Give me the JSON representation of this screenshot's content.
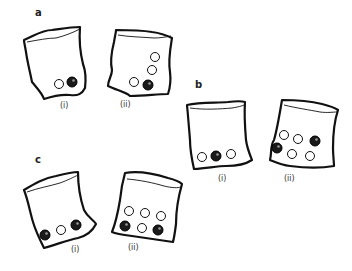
{
  "figure": {
    "panels": [
      {
        "label": "a",
        "bags": [
          {
            "label": "(i)",
            "marbles": {
              "white": 1,
              "black": 1
            }
          },
          {
            "label": "(ii)",
            "marbles": {
              "white": 3,
              "black": 1
            }
          }
        ]
      },
      {
        "label": "b",
        "bags": [
          {
            "label": "(i)",
            "marbles": {
              "white": 2,
              "black": 1
            }
          },
          {
            "label": "(ii)",
            "marbles": {
              "white": 4,
              "black": 2
            }
          }
        ]
      },
      {
        "label": "c",
        "bags": [
          {
            "label": "(i)",
            "marbles": {
              "white": 1,
              "black": 2
            }
          },
          {
            "label": "(ii)",
            "marbles": {
              "white": 4,
              "black": 2
            }
          }
        ]
      }
    ],
    "colors": {
      "outline": "#111111",
      "black_marble": "#1a1a1a",
      "background": "#ffffff"
    }
  }
}
